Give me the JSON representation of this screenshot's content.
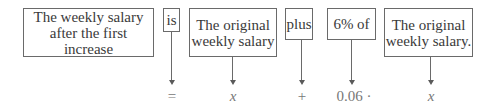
{
  "diagram": {
    "phrases": [
      {
        "id": "weekly-salary-after-increase",
        "text": "The weekly salary after the first increase"
      },
      {
        "id": "is",
        "text": "is"
      },
      {
        "id": "original-weekly-salary-1",
        "text": "The original weekly salary"
      },
      {
        "id": "plus",
        "text": "plus"
      },
      {
        "id": "six-percent-of",
        "text": "6% of"
      },
      {
        "id": "original-weekly-salary-2",
        "text": "The original weekly salary."
      }
    ],
    "symbols": [
      {
        "for": "is",
        "text": "="
      },
      {
        "for": "original-weekly-salary-1",
        "text": "x"
      },
      {
        "for": "plus",
        "text": "+"
      },
      {
        "for": "six-percent-of",
        "text": "0.06 ·"
      },
      {
        "for": "original-weekly-salary-2",
        "text": "x"
      }
    ],
    "colors": {
      "border": "#6a6a6a",
      "text": "#3a3a3a",
      "symbol": "#777777"
    }
  }
}
